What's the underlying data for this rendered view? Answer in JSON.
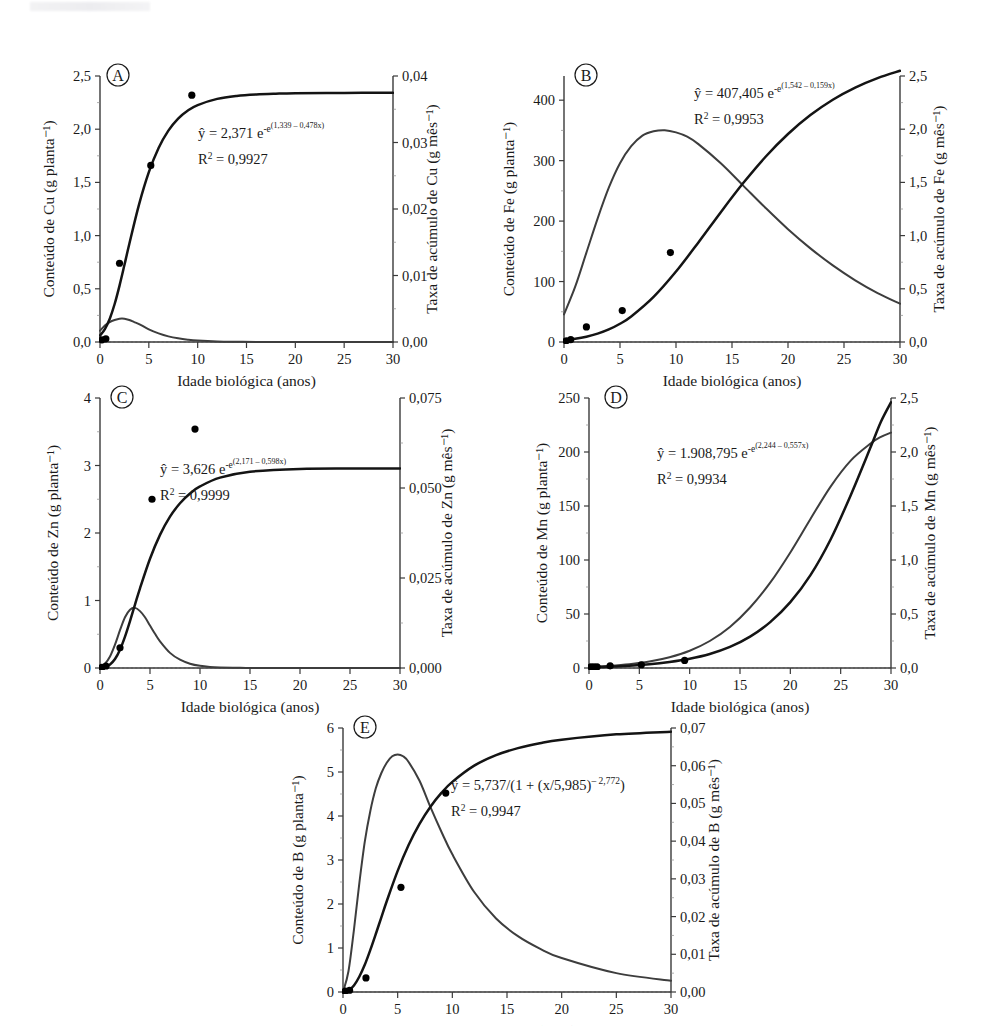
{
  "figure": {
    "name": "nutrient-accumulation-panels",
    "panels": [
      "A",
      "B",
      "C",
      "D",
      "E"
    ]
  },
  "common": {
    "xlabel": "Idade biológica (anos)",
    "xticks": [
      "0",
      "5",
      "10",
      "15",
      "20",
      "25",
      "30"
    ],
    "xlim": [
      0,
      30
    ],
    "letter_A": "A",
    "letter_B": "B",
    "letter_C": "C",
    "letter_D": "D",
    "letter_E": "E"
  },
  "chart_data": [
    {
      "id": "A",
      "type": "line",
      "title": "A",
      "xlabel": "Idade biológica (anos)",
      "ylabel": "Conteúdo de Cu (g planta⁻¹)",
      "y2label": "Taxa de acúmulo de Cu (g mês⁻¹)",
      "xlim": [
        0,
        30
      ],
      "ylim": [
        0,
        2.5
      ],
      "y2lim": [
        0,
        0.04
      ],
      "xticks": [
        "0",
        "5",
        "10",
        "15",
        "20",
        "25",
        "30"
      ],
      "yticks": [
        "0,0",
        "0,5",
        "1,0",
        "1,5",
        "2,0",
        "2,5"
      ],
      "y2ticks": [
        "0,00",
        "0,01",
        "0,02",
        "0,03",
        "0,04"
      ],
      "equation_plain": "ŷ = 2,371 e^-e^(1,339 - 0,478x)",
      "eq_lhs": "ŷ = 2,371 e",
      "eq_exp1": "-e",
      "eq_exp2": "(1,339 – 0,478x)",
      "r2_label": "R",
      "r2_sup": "2",
      "r2_value": " = 0,9927",
      "model": "gompertz",
      "params": {
        "a": 2.371,
        "b": 1.339,
        "k": 0.478
      },
      "content_series": {
        "name": "Conteúdo de Cu",
        "x": [
          0,
          0.5,
          1,
          1.5,
          2,
          2.5,
          3,
          4,
          5,
          6,
          7,
          8,
          9,
          10,
          12,
          14,
          16,
          18,
          20,
          25,
          30
        ],
        "y": [
          0.061,
          0.122,
          0.219,
          0.357,
          0.53,
          0.723,
          0.921,
          1.293,
          1.596,
          1.824,
          1.987,
          2.1,
          2.176,
          2.227,
          2.285,
          2.313,
          2.327,
          2.334,
          2.338,
          2.341,
          2.342
        ]
      },
      "rate_series": {
        "name": "Taxa de acúmulo de Cu",
        "x": [
          0,
          0.5,
          1,
          1.5,
          2,
          2.5,
          3,
          3.5,
          4,
          5,
          6,
          7,
          8,
          9,
          10,
          12,
          14,
          16,
          20,
          25,
          30
        ],
        "y": [
          0.0017,
          0.0025,
          0.003,
          0.0033,
          0.0035,
          0.0035,
          0.0033,
          0.003,
          0.0027,
          0.0019,
          0.0013,
          0.00085,
          0.00055,
          0.00035,
          0.00022,
          8e-05,
          3e-05,
          1e-05,
          1e-06,
          1e-07,
          0.0
        ]
      },
      "points": [
        [
          0.2,
          0.02
        ],
        [
          0.6,
          0.03
        ],
        [
          2.0,
          0.74
        ],
        [
          5.2,
          1.66
        ],
        [
          9.4,
          2.32
        ]
      ]
    },
    {
      "id": "B",
      "type": "line",
      "title": "B",
      "xlabel": "Idade biológica (anos)",
      "ylabel": "Conteúdo de Fe (g planta⁻¹)",
      "y2label": "Taxa de acúmulo de Fe (g mês⁻¹)",
      "xlim": [
        0,
        30
      ],
      "ylim": [
        0,
        440
      ],
      "y2lim": [
        0,
        2.5
      ],
      "xticks": [
        "0",
        "5",
        "10",
        "15",
        "20",
        "25",
        "30"
      ],
      "yticks": [
        "0",
        "100",
        "200",
        "300",
        "400"
      ],
      "y2ticks": [
        "0,0",
        "0,5",
        "1,0",
        "1,5",
        "2,0",
        "2,5"
      ],
      "equation_plain": "ŷ = 407,405 e^-e^(1,542 - 0,159x)",
      "eq_lhs": "ŷ = 407,405 e",
      "eq_exp1": "-e",
      "eq_exp2": "(1,542 – 0,159x)",
      "r2_label": "R",
      "r2_sup": "2",
      "r2_value": " = 0,9953",
      "model": "gompertz",
      "params": {
        "a": 407.405,
        "b": 1.542,
        "k": 0.159
      },
      "content_series": {
        "name": "Conteúdo de Fe",
        "x": [
          0,
          1,
          2,
          3,
          4,
          5,
          6,
          8,
          10,
          12,
          14,
          16,
          18,
          20,
          22,
          24,
          26,
          28,
          30
        ],
        "y": [
          3.2,
          5.4,
          8.8,
          13.8,
          20.8,
          30.2,
          42.2,
          74.6,
          116.5,
          164.7,
          214.8,
          262.9,
          306.4,
          344.0,
          375.3,
          400.7,
          420.8,
          436.5,
          448.6
        ]
      },
      "rate_series": {
        "name": "Taxa de acúmulo de Fe",
        "x": [
          0,
          1,
          2,
          3,
          4,
          5,
          6,
          7,
          8,
          9,
          10,
          11,
          12,
          14,
          16,
          18,
          20,
          22,
          24,
          26,
          28,
          30
        ],
        "y": [
          0.26,
          0.52,
          0.84,
          1.16,
          1.45,
          1.68,
          1.84,
          1.94,
          1.98,
          1.99,
          1.97,
          1.93,
          1.86,
          1.68,
          1.47,
          1.26,
          1.06,
          0.88,
          0.72,
          0.58,
          0.46,
          0.36
        ]
      },
      "points": [
        [
          0.2,
          2
        ],
        [
          0.6,
          4
        ],
        [
          2.0,
          25
        ],
        [
          5.2,
          52
        ],
        [
          9.5,
          148
        ]
      ]
    },
    {
      "id": "C",
      "type": "line",
      "title": "C",
      "xlabel": "Idade biológica (anos)",
      "ylabel": "Conteúdo de Zn (g planta⁻¹)",
      "y2label": "Taxa de acúmulo de Zn (g mês⁻¹)",
      "xlim": [
        0,
        30
      ],
      "ylim": [
        0,
        4
      ],
      "y2lim": [
        0,
        0.075
      ],
      "xticks": [
        "0",
        "5",
        "10",
        "15",
        "20",
        "25",
        "30"
      ],
      "yticks": [
        "0",
        "1",
        "2",
        "3",
        "4"
      ],
      "y2ticks": [
        "0,000",
        "0,025",
        "0,050",
        "0,075"
      ],
      "equation_plain": "ŷ = 3,626 e^-e^(2,171 - 0,598x)",
      "eq_lhs": "ŷ = 3,626 e",
      "eq_exp1": "-e",
      "eq_exp2": "(2,171 – 0,598x)",
      "r2_label": "R",
      "r2_sup": "2",
      "r2_value": " = 0,9999",
      "model": "gompertz",
      "params": {
        "a": 3.626,
        "b": 2.171,
        "k": 0.598
      },
      "content_series": {
        "name": "Conteúdo de Zn",
        "x": [
          0,
          0.5,
          1,
          1.5,
          2,
          2.5,
          3,
          3.5,
          4,
          5,
          6,
          7,
          8,
          9,
          10,
          12,
          15,
          20,
          25,
          30
        ],
        "y": [
          0.0039,
          0.0166,
          0.053,
          0.1335,
          0.2718,
          0.4652,
          0.6951,
          0.9395,
          1.1812,
          1.6185,
          1.9721,
          2.2419,
          2.441,
          2.5854,
          2.6894,
          2.82,
          2.9072,
          2.9496,
          2.9559,
          2.9569
        ]
      },
      "rate_series": {
        "name": "Taxa de acúmulo de Zn",
        "x": [
          0,
          0.5,
          1,
          1.5,
          2,
          2.5,
          3,
          3.5,
          4,
          4.5,
          5,
          5.5,
          6,
          7,
          8,
          9,
          10,
          11,
          12,
          14,
          16,
          20,
          26,
          30
        ],
        "y": [
          0.0003,
          0.0012,
          0.0032,
          0.0065,
          0.0105,
          0.0141,
          0.0162,
          0.0167,
          0.0158,
          0.0141,
          0.0118,
          0.0095,
          0.0074,
          0.0042,
          0.0023,
          0.0012,
          0.0006,
          0.0003,
          0.00016,
          4e-05,
          1e-05,
          0.0,
          0.0,
          0.0
        ]
      },
      "points": [
        [
          0.2,
          0.01
        ],
        [
          0.6,
          0.03
        ],
        [
          2.0,
          0.3
        ],
        [
          5.2,
          2.5
        ],
        [
          9.5,
          3.54
        ]
      ]
    },
    {
      "id": "D",
      "type": "line",
      "title": "D",
      "xlabel": "Idade biológica (anos)",
      "ylabel": "Conteúdo de Mn (g planta⁻¹)",
      "y2label": "Taxa de acúmulo de Mn (g mês⁻¹)",
      "xlim": [
        0,
        30
      ],
      "ylim": [
        0,
        250
      ],
      "y2lim": [
        0,
        2.5
      ],
      "xticks": [
        "0",
        "5",
        "10",
        "15",
        "20",
        "25",
        "30"
      ],
      "yticks": [
        "0",
        "50",
        "100",
        "150",
        "200",
        "250"
      ],
      "y2ticks": [
        "0,0",
        "0,5",
        "1,0",
        "1,5",
        "2,0",
        "2,5"
      ],
      "equation_plain": "ŷ = 1.908,795 e^-e^(2,244 - 0,557x)",
      "eq_lhs": "ŷ = 1.908,795 e",
      "eq_exp1": "-e",
      "eq_exp2": "(2,244 – 0,557x)",
      "r2_label": "R",
      "r2_sup": "2",
      "r2_value": " = 0,9934",
      "model": "exponential-rise",
      "params": {
        "a": 1908.795,
        "b": 2.244,
        "k": 0.557
      },
      "content_series": {
        "name": "Conteúdo de Mn",
        "x": [
          0,
          2,
          4,
          6,
          8,
          10,
          12,
          14,
          16,
          18,
          20,
          22,
          24,
          26,
          28,
          29,
          30
        ],
        "y": [
          0.8,
          1.2,
          2.0,
          3.4,
          5.6,
          8.6,
          13.0,
          19.5,
          29.0,
          42.5,
          61.0,
          86.0,
          119.0,
          160.0,
          205.0,
          228.0,
          246.0
        ]
      },
      "rate_series": {
        "name": "Taxa de acúmulo de Mn",
        "x": [
          0,
          2,
          4,
          6,
          8,
          10,
          12,
          14,
          16,
          18,
          20,
          22,
          24,
          26,
          28,
          29,
          30
        ],
        "y": [
          0.01,
          0.02,
          0.035,
          0.06,
          0.1,
          0.16,
          0.25,
          0.38,
          0.56,
          0.79,
          1.07,
          1.38,
          1.68,
          1.92,
          2.08,
          2.14,
          2.18
        ]
      },
      "points": [
        [
          0.2,
          1
        ],
        [
          0.5,
          1
        ],
        [
          0.8,
          1
        ],
        [
          2.1,
          2
        ],
        [
          5.2,
          3
        ],
        [
          9.5,
          7
        ]
      ]
    },
    {
      "id": "E",
      "type": "line",
      "title": "E",
      "xlabel": "Idade biológica (anos)",
      "ylabel": "Conteúdo de B (g planta⁻¹)",
      "y2label": "Taxa de acúmulo de B (g mês⁻¹)",
      "xlim": [
        0,
        30
      ],
      "ylim": [
        0,
        6
      ],
      "y2lim": [
        0,
        0.07
      ],
      "xticks": [
        "0",
        "5",
        "10",
        "15",
        "20",
        "25",
        "30"
      ],
      "yticks": [
        "0",
        "1",
        "2",
        "3",
        "4",
        "5",
        "6"
      ],
      "y2ticks": [
        "0,00",
        "0,01",
        "0,02",
        "0,03",
        "0,04",
        "0,05",
        "0,06",
        "0,07"
      ],
      "equation_plain": "ŷ = 5,737/(1 + (x/5,985)^-2,772)",
      "eq_lhs": "ŷ = 5,737/(1 + (x/5,985)",
      "eq_exp1": "– 2,772",
      "eq_exp2": "",
      "r2_label": "R",
      "r2_sup": "2",
      "r2_value": " = 0,9947",
      "model": "logistic-power",
      "params": {
        "a": 5.737,
        "x0": 5.985,
        "p": 2.772
      },
      "content_series": {
        "name": "Conteúdo de B",
        "x": [
          0,
          0.5,
          1,
          1.5,
          2,
          2.5,
          3,
          3.5,
          4,
          5,
          6,
          7,
          8,
          9,
          10,
          12,
          14,
          16,
          18,
          20,
          25,
          30
        ],
        "y": [
          0.0,
          0.035,
          0.148,
          0.353,
          0.625,
          0.957,
          1.318,
          1.692,
          2.063,
          2.752,
          3.34,
          3.821,
          4.211,
          4.524,
          4.776,
          5.144,
          5.383,
          5.543,
          5.655,
          5.734,
          5.856,
          5.916
        ]
      },
      "rate_series": {
        "name": "Taxa de acúmulo de B",
        "x": [
          0,
          0.5,
          1,
          1.5,
          2,
          2.5,
          3,
          3.5,
          4,
          4.5,
          5,
          5.5,
          6,
          7,
          8,
          9,
          10,
          12,
          14,
          16,
          18,
          20,
          25,
          30
        ],
        "y": [
          0.0,
          0.0055,
          0.0165,
          0.029,
          0.04,
          0.048,
          0.054,
          0.058,
          0.0608,
          0.0625,
          0.063,
          0.0625,
          0.061,
          0.056,
          0.049,
          0.0425,
          0.0365,
          0.0265,
          0.0195,
          0.0148,
          0.0115,
          0.009,
          0.005,
          0.003
        ]
      },
      "points": [
        [
          0.2,
          0.02
        ],
        [
          0.6,
          0.04
        ],
        [
          2.1,
          0.32
        ],
        [
          5.3,
          2.38
        ],
        [
          9.4,
          4.52
        ]
      ]
    }
  ]
}
